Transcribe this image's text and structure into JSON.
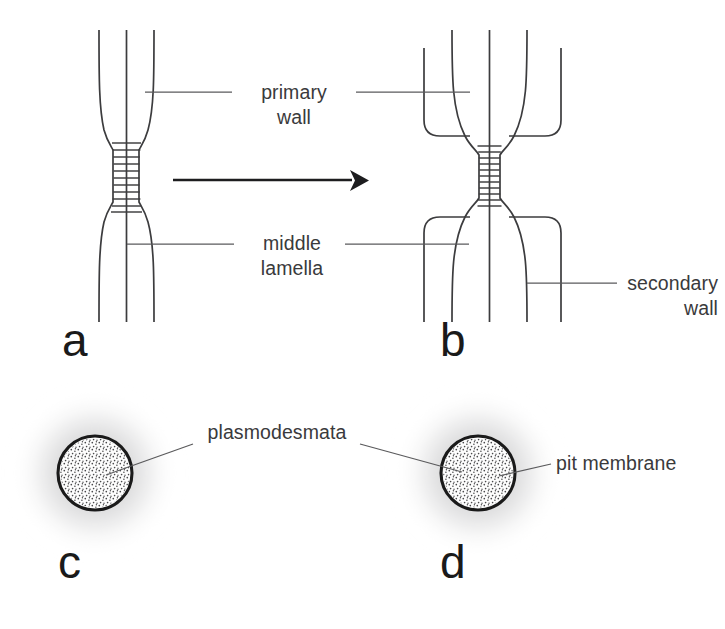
{
  "figure": {
    "background_color": "#ffffff",
    "line_color": "#3c3c3e",
    "text_color": "#3a3a3c",
    "halo_color": "#d9d9da"
  },
  "panels": [
    {
      "id": "a",
      "letter": "a",
      "caption": "primary cell wall with primary pit field",
      "center_x": 122,
      "letter_x": 62,
      "letter_y": 356
    },
    {
      "id": "b",
      "letter": "b",
      "caption": "secondary wall deposited, forming a pit",
      "center_x": 500,
      "letter_x": 440,
      "letter_y": 356
    },
    {
      "id": "c",
      "letter": "c",
      "caption": "face view of primary pit field",
      "center_x": 95,
      "letter_x": 58,
      "letter_y": 578
    },
    {
      "id": "d",
      "letter": "d",
      "caption": "face view of pit membrane",
      "center_x": 478,
      "letter_x": 440,
      "letter_y": 578
    }
  ],
  "labels": {
    "primary_wall": {
      "name": "primary-wall",
      "line1": "primary",
      "line2": "wall",
      "x": 294,
      "y1": 99,
      "y2": 124
    },
    "middle_lamella": {
      "name": "middle-lamella",
      "line1": "middle",
      "line2": "lamella",
      "x": 292,
      "y1": 250,
      "y2": 275
    },
    "secondary_wall": {
      "name": "secondary-wall",
      "line1": "secondary",
      "line2": "wall",
      "x": 718,
      "y1": 285,
      "y2": 310
    },
    "plasmodesmata": {
      "name": "plasmodesmata",
      "text": "plasmodesmata",
      "x": 277,
      "y": 439
    },
    "pit_membrane": {
      "name": "pit-membrane",
      "text": "pit membrane",
      "x": 556,
      "y": 470
    }
  },
  "arrow": {
    "name": "transformation-arrow",
    "x1": 173,
    "x2": 352,
    "y": 180,
    "tip_x": 367
  },
  "pit_fields": [
    {
      "panel": "c",
      "cx": 95,
      "cy": 473,
      "r": 37,
      "halo_r": 78,
      "stipple_count": 230
    },
    {
      "panel": "d",
      "cx": 478,
      "cy": 473,
      "r": 37,
      "halo_r": 78,
      "stipple_count": 230
    }
  ],
  "pit_ladder": {
    "rung_count": 11,
    "vertical_strands": 3,
    "top_y": 142,
    "bottom_y": 210
  }
}
